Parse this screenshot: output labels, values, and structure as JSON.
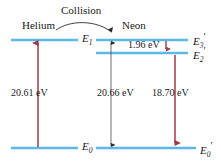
{
  "figure": {
    "collision_label": "Collision",
    "atoms": [
      {
        "name": "Helium",
        "label": "Helium"
      },
      {
        "name": "Neon",
        "label": "Neon"
      }
    ],
    "colors": {
      "level_line": "#5BB9E8",
      "red_arrow": "#9E3B46",
      "black_arrow": "#4a4a4a",
      "text": "#1a1a1a",
      "background": "#ffffff"
    }
  },
  "levels": {
    "helium": [
      {
        "id": "E1",
        "symbol": "E",
        "subscript": "1",
        "prime": "",
        "y": 40
      },
      {
        "id": "E0",
        "symbol": "E",
        "subscript": "0",
        "prime": "",
        "y": 148
      }
    ],
    "neon": [
      {
        "id": "E3p",
        "symbol": "E",
        "subscript": "3",
        "prime": "′",
        "y": 40
      },
      {
        "id": "E2p",
        "symbol": "E",
        "subscript": "2",
        "prime": "′",
        "y": 53
      },
      {
        "id": "E0p",
        "symbol": "E",
        "subscript": "0",
        "prime": "′",
        "y": 148
      }
    ]
  },
  "transitions": [
    {
      "id": "helium-excitation",
      "energy": "20.61 eV",
      "color": "red",
      "direction": "up",
      "from": "E0",
      "to": "E1"
    },
    {
      "id": "neon-1.96",
      "energy": "1.96 eV",
      "color": "red",
      "direction": "down",
      "from": "E3p",
      "to": "E2p"
    },
    {
      "id": "neon-20.66",
      "energy": "20.66 eV",
      "color": "black",
      "direction": "both",
      "from": "E0p",
      "to": "E3p"
    },
    {
      "id": "neon-18.70",
      "energy": "18.70 eV",
      "color": "red",
      "direction": "down",
      "from": "E2p",
      "to": "E0p"
    }
  ],
  "labels": {
    "helium_name": "Helium",
    "neon_name": "Neon",
    "collision": "Collision",
    "ev_20_61": "20.61 eV",
    "ev_1_96": "1.96 eV",
    "ev_20_66": "20.66 eV",
    "ev_18_70": "18.70 eV",
    "E1_text": "E",
    "E1_sub": "1",
    "E0_text": "E",
    "E0_sub": "0",
    "E3p_text": "E",
    "E3p_sub": "3",
    "E3p_prime": "′",
    "E2p_text": "E",
    "E2p_sub": "2",
    "E2p_prime": "′",
    "E0p_text": "E",
    "E0p_sub": "0",
    "E0p_prime": "′"
  }
}
